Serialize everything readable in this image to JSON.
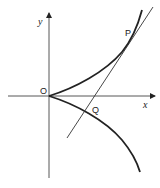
{
  "diagram": {
    "type": "semicubical-parabola-with-tangent",
    "axes": {
      "x_label": "x",
      "y_label": "y",
      "origin_label": "O"
    },
    "points": [
      {
        "id": "P",
        "label": "P"
      },
      {
        "id": "Q",
        "label": "Q"
      }
    ],
    "elements": [
      {
        "name": "upper-branch",
        "description": "curve from O rising to the upper right through P"
      },
      {
        "name": "lower-branch",
        "description": "curve from O falling to the lower right through Q"
      },
      {
        "name": "tangent-line",
        "description": "tangent at P crossing x-axis and meeting lower branch at Q"
      }
    ],
    "colors": {
      "ink": "#222222",
      "axis": "#444444",
      "background": "#ffffff"
    }
  }
}
